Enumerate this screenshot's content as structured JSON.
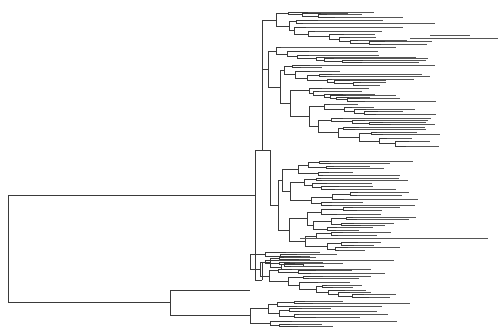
{
  "diagram": {
    "type": "phylogenetic-tree",
    "layout": "rectangular-cladogram",
    "orientation": "root-left",
    "labels_visible": false,
    "line_color": "#3a3a3a",
    "background": "#ffffff",
    "root": {
      "x": 8,
      "y1": 195,
      "y2": 302
    },
    "clades": [
      {
        "name": "upper-major-clade",
        "node": {
          "x": 255,
          "y1": 110,
          "y2": 280
        },
        "stem_y": 195,
        "subclades": [
          {
            "name": "clade-A",
            "node": {
              "x": 262,
              "y1": 60,
              "y2": 150
            }
          },
          {
            "name": "clade-B",
            "node": {
              "x": 278,
              "y1": 170,
              "y2": 245
            }
          },
          {
            "name": "clade-C",
            "node": {
              "x": 262,
              "y1": 255,
              "y2": 268
            }
          }
        ]
      },
      {
        "name": "lower-major-clade",
        "node": {
          "x": 170,
          "y1": 290,
          "y2": 315
        },
        "stem_y": 302,
        "subclades": [
          {
            "name": "clade-D",
            "node": {
              "x": 250,
              "y1": 270,
              "y2": 300
            }
          },
          {
            "name": "clade-E",
            "node": {
              "x": 250,
              "y1": 305,
              "y2": 326
            }
          }
        ]
      }
    ],
    "longest_tips": [
      {
        "y": 38,
        "x_end": 498
      },
      {
        "y": 236,
        "x_end": 488
      },
      {
        "y": 293,
        "x_end": 440
      }
    ]
  }
}
